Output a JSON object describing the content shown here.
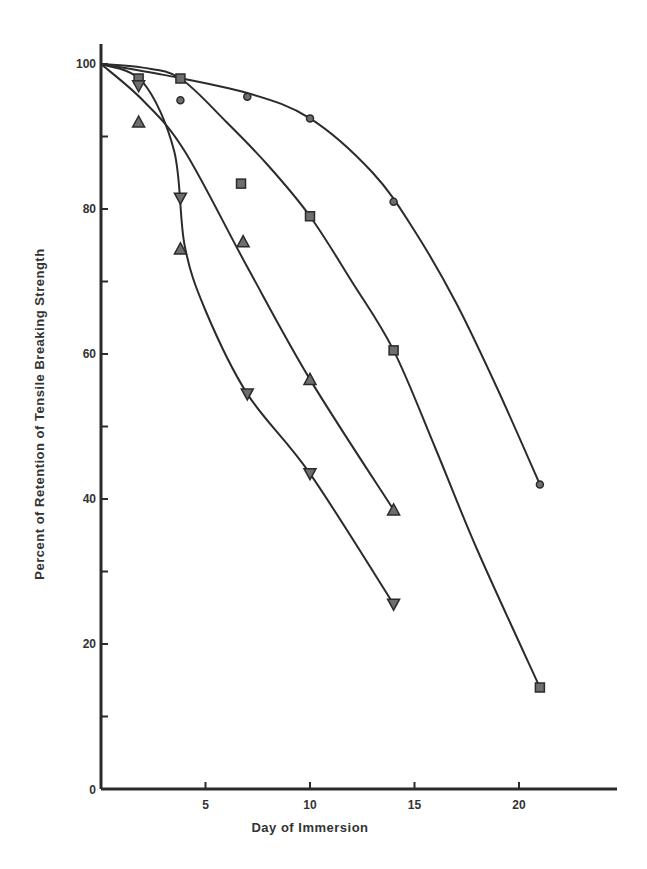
{
  "chart_data": {
    "type": "line",
    "title": "",
    "xlabel": "Day of Immersion",
    "ylabel": "Percent of Retention of Tensile Breaking Strength",
    "xlim": [
      0,
      24
    ],
    "ylim": [
      0,
      100
    ],
    "x_ticks": [
      5,
      10,
      15,
      20
    ],
    "x_tick_labels": [
      "5",
      "10",
      "15",
      "20"
    ],
    "y_ticks": [
      0,
      20,
      40,
      60,
      80,
      100
    ],
    "y_tick_labels": [
      "0",
      "20",
      "40",
      "60",
      "80",
      "100"
    ],
    "y_minor_ticks": [
      10,
      30,
      50,
      70,
      90
    ],
    "origin_label": "0",
    "grid": false,
    "legend": null,
    "series": [
      {
        "name": "circles",
        "marker": "circle",
        "x": [
          3.8,
          7,
          10,
          14,
          21
        ],
        "y": [
          95,
          95.5,
          92.5,
          81,
          42
        ],
        "curve": [
          [
            0,
            100
          ],
          [
            3,
            98.5
          ],
          [
            7,
            96
          ],
          [
            10,
            92.5
          ],
          [
            13,
            85
          ],
          [
            15,
            77
          ],
          [
            17,
            67
          ],
          [
            19,
            55
          ],
          [
            21,
            42
          ]
        ]
      },
      {
        "name": "squares",
        "marker": "square",
        "x": [
          1.8,
          3.8,
          6.7,
          10,
          14,
          21
        ],
        "y": [
          98,
          98,
          83.5,
          79,
          60.5,
          14
        ],
        "curve": [
          [
            0,
            100
          ],
          [
            2,
            99.5
          ],
          [
            3.8,
            98
          ],
          [
            6,
            92
          ],
          [
            8,
            86
          ],
          [
            10,
            79
          ],
          [
            12,
            70
          ],
          [
            14,
            60.5
          ],
          [
            16,
            47
          ],
          [
            18,
            33
          ],
          [
            21,
            14
          ]
        ]
      },
      {
        "name": "up-triangles",
        "marker": "triangle-up",
        "x": [
          1.8,
          3.8,
          6.8,
          10,
          14
        ],
        "y": [
          92,
          74.5,
          75.5,
          56.5,
          38.5
        ],
        "curve": [
          [
            0,
            100
          ],
          [
            2,
            95
          ],
          [
            4,
            88
          ],
          [
            7,
            72
          ],
          [
            10,
            56.5
          ],
          [
            14,
            38.5
          ]
        ]
      },
      {
        "name": "down-triangles",
        "marker": "triangle-down",
        "x": [
          1.8,
          3.8,
          7,
          10,
          14
        ],
        "y": [
          97,
          81.5,
          54.5,
          43.5,
          25.5
        ],
        "curve": [
          [
            0,
            100
          ],
          [
            2,
            97.5
          ],
          [
            3.5,
            88
          ],
          [
            4,
            75
          ],
          [
            5,
            66
          ],
          [
            7,
            54.5
          ],
          [
            10,
            43.5
          ],
          [
            14,
            25.5
          ]
        ]
      }
    ]
  }
}
